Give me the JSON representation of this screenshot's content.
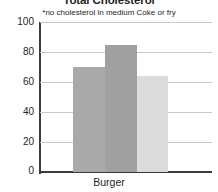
{
  "chart_data": {
    "type": "bar",
    "title": "Total Cholesterol",
    "subtitle": "*no cholesterol in medium Coke or fry",
    "xlabel": "Burger",
    "ylabel": "",
    "categories": [
      "Burger"
    ],
    "ylim": [
      0,
      100
    ],
    "yticks": [
      0,
      20,
      40,
      60,
      80,
      100
    ],
    "ytick_labels": [
      "0",
      "20",
      "40",
      "60",
      "80",
      "100"
    ],
    "grid": true,
    "legend": false,
    "series": [
      {
        "name": "bar-1",
        "values": [
          70
        ],
        "color": "#a9a9a9"
      },
      {
        "name": "bar-2",
        "values": [
          85
        ],
        "color": "#a0a0a0"
      },
      {
        "name": "bar-3",
        "values": [
          64
        ],
        "color": "#dcdcdc"
      }
    ],
    "bars": [
      {
        "id": "bar-1",
        "value": 70,
        "color": "#a9a9a9"
      },
      {
        "id": "bar-2",
        "value": 85,
        "color": "#a0a0a0"
      },
      {
        "id": "bar-3",
        "value": 64,
        "color": "#dcdcdc"
      }
    ]
  }
}
